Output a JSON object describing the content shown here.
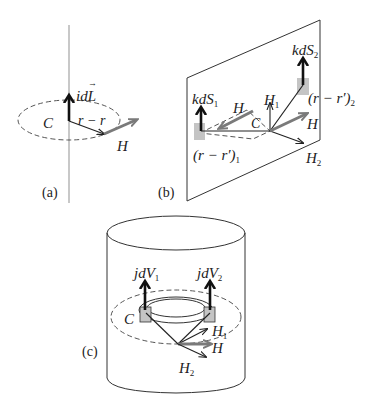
{
  "figure": {
    "panels": [
      {
        "id": "a",
        "caption": "(a)",
        "labels": {
          "current_element": "idL",
          "contour": "C",
          "displacement": "r − r",
          "field": "H"
        }
      },
      {
        "id": "b",
        "caption": "(b)",
        "labels": {
          "surface_element_1": "kdS",
          "surface_element_1_sub": "1",
          "surface_element_2": "kdS",
          "surface_element_2_sub": "2",
          "field": "H",
          "field_1": "H",
          "field_1_sub": "1",
          "field_2": "H",
          "field_2_sub": "2",
          "contour": "C",
          "displacement_1": "(r − r′)",
          "displacement_1_sub": "1",
          "displacement_2": "(r − r′)",
          "displacement_2_sub": "2"
        }
      },
      {
        "id": "c",
        "caption": "(c)",
        "labels": {
          "volume_element_1": "jdV",
          "volume_element_1_sub": "1",
          "volume_element_2": "jdV",
          "volume_element_2_sub": "2",
          "contour": "C",
          "field": "H",
          "field_1": "H",
          "field_1_sub": "1",
          "field_2": "H",
          "field_2_sub": "2"
        }
      }
    ],
    "colors": {
      "line": "#222222",
      "field_arrow": "#7a7a7a",
      "wire": "#c8c8c8",
      "element_fill": "#c4c4c4",
      "dashed": "#555555"
    }
  }
}
